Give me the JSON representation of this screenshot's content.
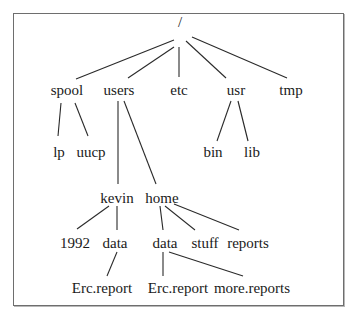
{
  "diagram": {
    "type": "directory-tree",
    "nodes": {
      "root": {
        "label": "/",
        "x": 180,
        "y": 27
      },
      "spool": {
        "label": "spool",
        "x": 67,
        "y": 95
      },
      "users": {
        "label": "users",
        "x": 119,
        "y": 95
      },
      "etc": {
        "label": "etc",
        "x": 179,
        "y": 95
      },
      "usr": {
        "label": "usr",
        "x": 236,
        "y": 95
      },
      "tmp": {
        "label": "tmp",
        "x": 291,
        "y": 95
      },
      "lp": {
        "label": "lp",
        "x": 59,
        "y": 157
      },
      "uucp": {
        "label": "uucp",
        "x": 91,
        "y": 157
      },
      "bin": {
        "label": "bin",
        "x": 213,
        "y": 157
      },
      "lib": {
        "label": "lib",
        "x": 252,
        "y": 157
      },
      "kevin": {
        "label": "kevin",
        "x": 117,
        "y": 203
      },
      "home": {
        "label": "home",
        "x": 162,
        "y": 203
      },
      "k_1992": {
        "label": "1992",
        "x": 75,
        "y": 248
      },
      "k_data": {
        "label": "data",
        "x": 115,
        "y": 248
      },
      "h_data": {
        "label": "data",
        "x": 165,
        "y": 248
      },
      "h_stuff": {
        "label": "stuff",
        "x": 205,
        "y": 248
      },
      "h_reports": {
        "label": "reports",
        "x": 248,
        "y": 248
      },
      "k_erc": {
        "label": "Erc.report",
        "x": 102,
        "y": 293
      },
      "h_erc": {
        "label": "Erc.report",
        "x": 178,
        "y": 293
      },
      "h_more": {
        "label": "more.reports",
        "x": 252,
        "y": 293
      }
    },
    "edges": [
      {
        "from": "root",
        "to": "spool",
        "x1": 174,
        "y1": 40,
        "x2": 76,
        "y2": 79
      },
      {
        "from": "root",
        "to": "users",
        "x1": 174,
        "y1": 47,
        "x2": 128,
        "y2": 78
      },
      {
        "from": "root",
        "to": "etc",
        "x1": 179,
        "y1": 47,
        "x2": 179,
        "y2": 77
      },
      {
        "from": "root",
        "to": "usr",
        "x1": 186,
        "y1": 41,
        "x2": 226,
        "y2": 78
      },
      {
        "from": "root",
        "to": "tmp",
        "x1": 192,
        "y1": 37,
        "x2": 287,
        "y2": 78
      },
      {
        "from": "spool",
        "to": "lp",
        "x1": 61,
        "y1": 103,
        "x2": 58,
        "y2": 136
      },
      {
        "from": "spool",
        "to": "uucp",
        "x1": 75,
        "y1": 103,
        "x2": 88,
        "y2": 136
      },
      {
        "from": "usr",
        "to": "bin",
        "x1": 231,
        "y1": 101,
        "x2": 217,
        "y2": 141
      },
      {
        "from": "usr",
        "to": "lib",
        "x1": 238,
        "y1": 101,
        "x2": 248,
        "y2": 141
      },
      {
        "from": "users",
        "to": "kevin",
        "x1": 118,
        "y1": 101,
        "x2": 118,
        "y2": 184
      },
      {
        "from": "users",
        "to": "home",
        "x1": 124,
        "y1": 101,
        "x2": 156,
        "y2": 184
      },
      {
        "from": "kevin",
        "to": "k_1992",
        "x1": 109,
        "y1": 206,
        "x2": 77,
        "y2": 229
      },
      {
        "from": "kevin",
        "to": "k_data",
        "x1": 117,
        "y1": 206,
        "x2": 117,
        "y2": 230
      },
      {
        "from": "home",
        "to": "h_data",
        "x1": 160,
        "y1": 206,
        "x2": 163,
        "y2": 230
      },
      {
        "from": "home",
        "to": "h_stuff",
        "x1": 165,
        "y1": 206,
        "x2": 195,
        "y2": 230
      },
      {
        "from": "home",
        "to": "h_reports",
        "x1": 174,
        "y1": 204,
        "x2": 239,
        "y2": 230
      },
      {
        "from": "k_data",
        "to": "k_erc",
        "x1": 117,
        "y1": 252,
        "x2": 107,
        "y2": 276
      },
      {
        "from": "h_data",
        "to": "h_erc",
        "x1": 163,
        "y1": 252,
        "x2": 163,
        "y2": 276
      },
      {
        "from": "h_data",
        "to": "h_more",
        "x1": 169,
        "y1": 252,
        "x2": 243,
        "y2": 276
      }
    ]
  }
}
